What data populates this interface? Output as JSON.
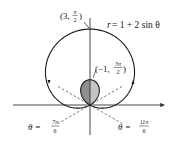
{
  "figure": {
    "equation": {
      "lhs": "r",
      "rhs": "= 1 + 2 sin θ"
    },
    "curve": {
      "a": 1,
      "b": 2,
      "function": "sin",
      "origin_px": [
        90,
        105
      ],
      "scale_px_per_unit": 25.3
    },
    "points": [
      {
        "label_open": "(3, ",
        "num": "π",
        "den": "2",
        "label_close": ")",
        "r": 3,
        "theta": "π/2"
      },
      {
        "label_open": "(−1, ",
        "num": "3π",
        "den": "2",
        "label_close": ")",
        "r": -1,
        "theta": "3π/2"
      }
    ],
    "tangent_lines": [
      {
        "lhs": "θ =",
        "num": "7π",
        "den": "6"
      },
      {
        "lhs": "θ =",
        "num": "11π",
        "den": "6"
      }
    ],
    "colors": {
      "curve": "#1a1a1a",
      "axis": "#333333",
      "dashed": "#555555",
      "inner_fill_left": "#8f8f8f",
      "inner_fill_right": "#c4c4c4"
    }
  }
}
